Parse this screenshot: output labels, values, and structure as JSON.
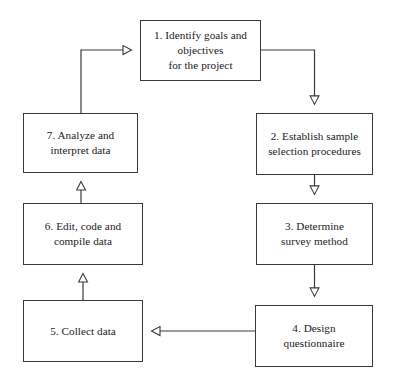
{
  "diagram": {
    "style": {
      "background": "#ffffff",
      "box_border_color": "#3a3a3a",
      "line_color": "#3a3a3a",
      "text_color": "#1a1a1a",
      "arrowhead": "hollow-triangle"
    },
    "nodes": [
      {
        "id": "step1",
        "label": "1.  Identify goals and\nobjectives\nfor the project",
        "x": 140,
        "y": 20,
        "w": 121,
        "h": 61
      },
      {
        "id": "step2",
        "label": "2.  Establish sample\nselection procedures",
        "x": 256,
        "y": 113,
        "w": 117,
        "h": 62
      },
      {
        "id": "step3",
        "label": "3.  Determine\nsurvey method",
        "x": 256,
        "y": 203,
        "w": 117,
        "h": 62
      },
      {
        "id": "step4",
        "label": "4.  Design questionnaire",
        "x": 255,
        "y": 305,
        "w": 118,
        "h": 62
      },
      {
        "id": "step5",
        "label": "5.  Collect data",
        "x": 23,
        "y": 300,
        "w": 120,
        "h": 62
      },
      {
        "id": "step6",
        "label": "6.  Edit, code and\ncompile data",
        "x": 23,
        "y": 203,
        "w": 120,
        "h": 62
      },
      {
        "id": "step7",
        "label": "7.  Analyze and\ninterpret data",
        "x": 23,
        "y": 113,
        "w": 115,
        "h": 60
      }
    ],
    "edges": [
      {
        "id": "edge-1-2",
        "from": "step1",
        "to": "step2",
        "direction": "down"
      },
      {
        "id": "edge-2-3",
        "from": "step2",
        "to": "step3",
        "direction": "down"
      },
      {
        "id": "edge-3-4",
        "from": "step3",
        "to": "step4",
        "direction": "down"
      },
      {
        "id": "edge-4-5",
        "from": "step4",
        "to": "step5",
        "direction": "left"
      },
      {
        "id": "edge-5-6",
        "from": "step5",
        "to": "step6",
        "direction": "up"
      },
      {
        "id": "edge-6-7",
        "from": "step6",
        "to": "step7",
        "direction": "up"
      },
      {
        "id": "edge-7-1",
        "from": "step7",
        "to": "step1",
        "direction": "up-right"
      }
    ]
  }
}
